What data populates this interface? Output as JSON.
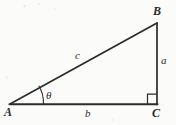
{
  "figure": {
    "background_color": "#fbfbfa",
    "stroke_color": "#2b2b2b",
    "vertices": {
      "A": {
        "label": "A",
        "x": 10,
        "y": 104
      },
      "B": {
        "label": "B",
        "x": 157,
        "y": 23
      },
      "C": {
        "label": "C",
        "x": 157,
        "y": 104
      }
    },
    "vertex_labels": {
      "a_label": "A",
      "b_label": "B",
      "c_label": "C"
    },
    "side_labels": {
      "opposite": "a",
      "adjacent": "b",
      "hypotenuse": "c"
    },
    "angle_label": "θ",
    "right_angle_marker": "right-angle-square",
    "sides": [
      {
        "name": "hypotenuse",
        "label": "c",
        "from": "A",
        "to": "B"
      },
      {
        "name": "opposite",
        "label": "a",
        "from": "B",
        "to": "C"
      },
      {
        "name": "adjacent",
        "label": "b",
        "from": "A",
        "to": "C"
      }
    ]
  }
}
